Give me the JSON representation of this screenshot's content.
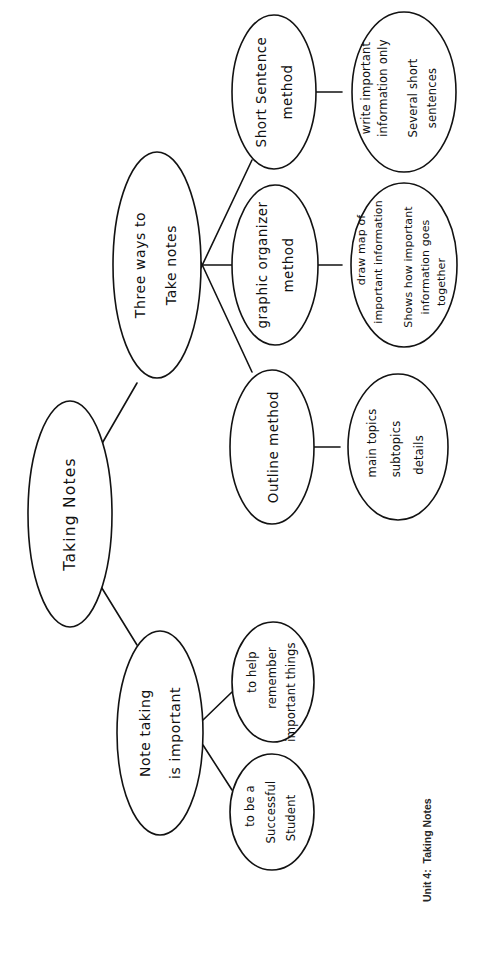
{
  "document": {
    "title": "Taking Notes Concept Map",
    "caption": "Unit 4:  Taking Notes",
    "ink_color": "#121212",
    "background_color": "#ffffff"
  },
  "diagram": {
    "type": "concept-map",
    "orientation": "rotated-90-counterclockwise",
    "center": {
      "label": "Taking Notes"
    },
    "branches": [
      {
        "id": "three-ways",
        "label_lines": [
          "Three ways to",
          "Take notes"
        ],
        "children": [
          {
            "id": "short-sentence",
            "label_lines": [
              "Short Sentence",
              "method"
            ],
            "detail_lines": [
              "write important",
              "information only",
              "Several short",
              "sentences"
            ]
          },
          {
            "id": "graphic-organizer",
            "label_lines": [
              "graphic organizer",
              "method"
            ],
            "detail_lines": [
              "draw map of",
              "important information",
              "Shows how important",
              "information goes",
              "together"
            ]
          },
          {
            "id": "outline",
            "label_lines": [
              "Outline method"
            ],
            "detail_lines": [
              "main topics",
              "subtopics",
              "details"
            ]
          }
        ]
      },
      {
        "id": "note-taking-important",
        "label_lines": [
          "Note taking",
          "is important"
        ],
        "children": [
          {
            "id": "help-remember",
            "label_lines": [
              "to help",
              "remember",
              "important things"
            ],
            "detail_lines": []
          },
          {
            "id": "successful-student",
            "label_lines": [
              "to be a",
              "Successful",
              "Student"
            ],
            "detail_lines": []
          }
        ]
      }
    ]
  }
}
